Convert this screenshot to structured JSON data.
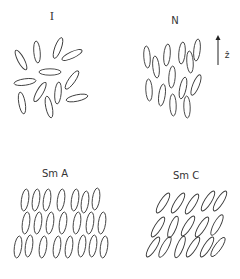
{
  "figure": {
    "stroke_color": "#3a3a3a",
    "background": "#ffffff"
  },
  "panels": [
    {
      "id": "isotropic",
      "label": "I",
      "label_pos": [
        52,
        20
      ],
      "molecule_size": [
        3.2,
        11
      ],
      "molecules": [
        {
          "x": 21,
          "y": 60,
          "angle": -28
        },
        {
          "x": 37,
          "y": 52,
          "angle": -5
        },
        {
          "x": 58,
          "y": 48,
          "angle": 20
        },
        {
          "x": 72,
          "y": 55,
          "angle": 65
        },
        {
          "x": 50,
          "y": 72,
          "angle": 90
        },
        {
          "x": 25,
          "y": 82,
          "angle": 82
        },
        {
          "x": 40,
          "y": 92,
          "angle": 30
        },
        {
          "x": 58,
          "y": 93,
          "angle": 5
        },
        {
          "x": 72,
          "y": 80,
          "angle": 35
        },
        {
          "x": 22,
          "y": 103,
          "angle": -10
        },
        {
          "x": 49,
          "y": 107,
          "angle": -12
        },
        {
          "x": 77,
          "y": 98,
          "angle": 78
        }
      ]
    },
    {
      "id": "nematic",
      "label": "N",
      "label_pos": [
        175,
        24
      ],
      "molecule_size": [
        3.2,
        11
      ],
      "molecules": [
        {
          "x": 147,
          "y": 57,
          "angle": -4
        },
        {
          "x": 156,
          "y": 67,
          "angle": -6
        },
        {
          "x": 167,
          "y": 55,
          "angle": 5
        },
        {
          "x": 182,
          "y": 53,
          "angle": 5
        },
        {
          "x": 190,
          "y": 62,
          "angle": -4
        },
        {
          "x": 197,
          "y": 50,
          "angle": 6
        },
        {
          "x": 172,
          "y": 77,
          "angle": 4
        },
        {
          "x": 149,
          "y": 90,
          "angle": -3
        },
        {
          "x": 162,
          "y": 95,
          "angle": 8
        },
        {
          "x": 173,
          "y": 105,
          "angle": -2
        },
        {
          "x": 183,
          "y": 88,
          "angle": 12
        },
        {
          "x": 187,
          "y": 107,
          "angle": -2
        },
        {
          "x": 196,
          "y": 85,
          "angle": 22
        }
      ],
      "director": {
        "label": "ẑ",
        "arrow_x": 218,
        "arrow_top": 35,
        "arrow_bottom": 65,
        "label_pos": [
          227,
          58
        ]
      }
    },
    {
      "id": "smectic-a",
      "label": "Sm A",
      "label_pos": [
        55,
        177
      ],
      "molecule_size": [
        3.6,
        11
      ],
      "molecules": [
        {
          "x": 25,
          "y": 200,
          "angle": 8
        },
        {
          "x": 36,
          "y": 200,
          "angle": 8
        },
        {
          "x": 47,
          "y": 200,
          "angle": 8
        },
        {
          "x": 61,
          "y": 200,
          "angle": 8
        },
        {
          "x": 75,
          "y": 200,
          "angle": 8
        },
        {
          "x": 85,
          "y": 202,
          "angle": 8
        },
        {
          "x": 96,
          "y": 199,
          "angle": 8
        },
        {
          "x": 26,
          "y": 223,
          "angle": 8
        },
        {
          "x": 38,
          "y": 223,
          "angle": 8
        },
        {
          "x": 50,
          "y": 223,
          "angle": 8
        },
        {
          "x": 63,
          "y": 223,
          "angle": 8
        },
        {
          "x": 77,
          "y": 223,
          "angle": 8
        },
        {
          "x": 90,
          "y": 223,
          "angle": 8
        },
        {
          "x": 102,
          "y": 223,
          "angle": 8
        },
        {
          "x": 18,
          "y": 247,
          "angle": 8
        },
        {
          "x": 29,
          "y": 246,
          "angle": 8
        },
        {
          "x": 43,
          "y": 247,
          "angle": 8
        },
        {
          "x": 57,
          "y": 247,
          "angle": 8
        },
        {
          "x": 69,
          "y": 247,
          "angle": 8
        },
        {
          "x": 82,
          "y": 246,
          "angle": 8
        },
        {
          "x": 93,
          "y": 246,
          "angle": 8
        },
        {
          "x": 104,
          "y": 247,
          "angle": 8
        }
      ]
    },
    {
      "id": "smectic-c",
      "label": "Sm C",
      "label_pos": [
        186,
        179
      ],
      "molecule_size": [
        3.4,
        11.5
      ],
      "molecules": [
        {
          "x": 163,
          "y": 203,
          "angle": 32
        },
        {
          "x": 178,
          "y": 203,
          "angle": 32
        },
        {
          "x": 192,
          "y": 204,
          "angle": 32
        },
        {
          "x": 208,
          "y": 201,
          "angle": 32
        },
        {
          "x": 220,
          "y": 201,
          "angle": 32
        },
        {
          "x": 158,
          "y": 227,
          "angle": 32
        },
        {
          "x": 173,
          "y": 227,
          "angle": 22
        },
        {
          "x": 188,
          "y": 226,
          "angle": 32
        },
        {
          "x": 202,
          "y": 227,
          "angle": 32
        },
        {
          "x": 217,
          "y": 225,
          "angle": 28
        },
        {
          "x": 153,
          "y": 247,
          "angle": 32
        },
        {
          "x": 165,
          "y": 247,
          "angle": 28
        },
        {
          "x": 180,
          "y": 247,
          "angle": 22
        },
        {
          "x": 193,
          "y": 247,
          "angle": 32
        },
        {
          "x": 207,
          "y": 247,
          "angle": 32
        },
        {
          "x": 218,
          "y": 247,
          "angle": 35
        }
      ]
    }
  ]
}
